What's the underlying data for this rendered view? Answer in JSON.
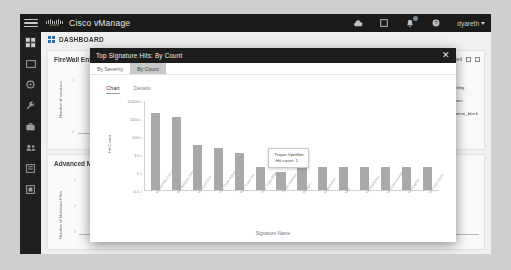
{
  "topbar": {
    "brand": "Cisco vManage",
    "logo_word": "cisco",
    "icons": [
      {
        "name": "cloud-icon",
        "glyph": "cloud"
      },
      {
        "name": "tasks-icon",
        "glyph": "tasks"
      },
      {
        "name": "alarms-icon",
        "glyph": "alarms",
        "badge": true
      },
      {
        "name": "help-icon",
        "glyph": "help"
      }
    ],
    "user": "dyareth"
  },
  "sidebar": {
    "items": [
      {
        "name": "sidebar-item-dashboard",
        "icon": "dashboard-icon",
        "active": true
      },
      {
        "name": "sidebar-item-monitor",
        "icon": "monitor-icon"
      },
      {
        "name": "sidebar-item-configuration",
        "icon": "gear-icon"
      },
      {
        "name": "sidebar-item-tools",
        "icon": "wrench-icon"
      },
      {
        "name": "sidebar-item-maintenance",
        "icon": "briefcase-icon"
      },
      {
        "name": "sidebar-item-administration",
        "icon": "users-icon"
      },
      {
        "name": "sidebar-item-reports",
        "icon": "report-icon"
      },
      {
        "name": "sidebar-item-workflows",
        "icon": "workflow-icon"
      }
    ]
  },
  "page": {
    "title": "DASHBOARD",
    "panel_a": {
      "title": "FireWall Enforcement",
      "ylabel": "Number of sessions",
      "ytop": "1",
      "ybottom": "0"
    },
    "panel_b": {
      "title": "Advanced Malware Protection",
      "ylabel": "Number of Malicious Files",
      "ytop": "4",
      "ymid": "2",
      "ybottom": "0"
    },
    "timerange": {
      "options": [
        "1h",
        "3h",
        "6h",
        "12h",
        "24h",
        "7days"
      ],
      "selected": "24h"
    },
    "toolbar": {
      "pill": "All",
      "label": "Allowed",
      "filter_icon": "filter-icon",
      "expand_icon": "expand-icon"
    },
    "legend": [
      {
        "label": "Gambling",
        "color": "#5f5f5f"
      },
      {
        "label": "Auctions",
        "color": "#6e6e6e"
      },
      {
        "label": "reputation_block",
        "color": "#4e4e4e"
      }
    ]
  },
  "modal": {
    "title": "Top Signature Hits: By Count",
    "close_icon": "close-icon",
    "tabs": [
      {
        "label": "By Severity",
        "active": false
      },
      {
        "label": "By Count",
        "active": true
      }
    ],
    "sub_tabs": [
      {
        "label": "Chart",
        "active": true
      },
      {
        "label": "Details",
        "active": false
      }
    ],
    "tooltip": {
      "line1": ".Trojan.Vpnfilter",
      "line2": "- Hit count: 1"
    }
  },
  "chart_data": {
    "type": "bar",
    "title": "Top Signature Hits: By Count",
    "xlabel": "Signature Name",
    "ylabel": "Hit Count",
    "yscale": "log",
    "ylim": [
      0.1,
      10000
    ],
    "yticks": [
      "10000",
      "1000",
      "100",
      "10",
      "1",
      "0.1"
    ],
    "bar_color": "#a9a9a9",
    "grid": false,
    "legend": "none",
    "categories": [
      "MALWARE-CNC D",
      "Win.Malware.Gho",
      "W.Trojan.Gen",
      "Osx.Trojan.Agent",
      "W32.Trojan.Ge",
      "Unix.Trojan.Mirai",
      ".Trojan.Vpnfilter",
      "Dropper",
      "W.Backdoor",
      "Misc",
      "Win.Backdoor",
      "Win.Ransomware",
      "Win.Exploit",
      "W.Trojan.Vpnfil"
    ],
    "values": [
      2000,
      1200,
      30,
      22,
      12,
      2,
      1,
      2,
      2,
      2,
      2,
      2,
      2,
      2
    ],
    "annotation": {
      "category": ".Trojan.Vpnfilter",
      "value": 1,
      "text": ".Trojan.Vpnfilter - Hit count: 1"
    }
  }
}
